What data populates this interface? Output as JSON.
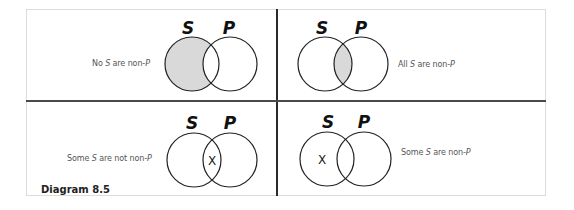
{
  "caption": "Diagram 8.5",
  "set_labels": {
    "left": "S",
    "right": "P"
  },
  "colors": {
    "shading": "#d9d9d9",
    "stroke": "#222222",
    "divider": "#2a2a2a"
  },
  "panels": [
    {
      "id": "top-left",
      "statement": {
        "pre": "No ",
        "s": "S",
        "mid": " are non-",
        "p": "P"
      },
      "shaded_region": "S-only",
      "x_mark_region": null
    },
    {
      "id": "top-right",
      "statement": {
        "pre": "All ",
        "s": "S",
        "mid": " are non-",
        "p": "P"
      },
      "shaded_region": "S-and-P",
      "x_mark_region": null
    },
    {
      "id": "bottom-left",
      "statement": {
        "pre": "Some ",
        "s": "S",
        "mid": " are not non-",
        "p": "P"
      },
      "shaded_region": null,
      "x_mark_region": "S-and-P",
      "x_mark": "X"
    },
    {
      "id": "bottom-right",
      "statement": {
        "pre": "Some ",
        "s": "S",
        "mid": " are non-",
        "p": "P"
      },
      "shaded_region": null,
      "x_mark_region": "S-only",
      "x_mark": "X"
    }
  ]
}
